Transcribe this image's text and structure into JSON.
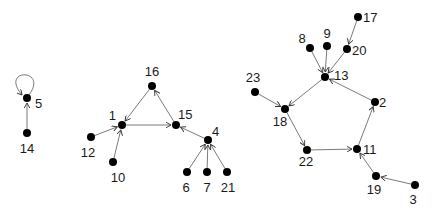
{
  "diagram": {
    "type": "directed-graph",
    "nodes": [
      {
        "id": "5",
        "x": 27,
        "y": 98,
        "lx": 35,
        "ly": 108,
        "anchor": "start"
      },
      {
        "id": "14",
        "x": 27,
        "y": 133,
        "lx": 27,
        "ly": 153,
        "anchor": "middle"
      },
      {
        "id": "16",
        "x": 152,
        "y": 86,
        "lx": 152,
        "ly": 76,
        "anchor": "middle"
      },
      {
        "id": "1",
        "x": 122,
        "y": 125,
        "lx": 116,
        "ly": 120,
        "anchor": "end"
      },
      {
        "id": "15",
        "x": 176,
        "y": 125,
        "lx": 178,
        "ly": 119,
        "anchor": "start"
      },
      {
        "id": "12",
        "x": 91,
        "y": 137,
        "lx": 88,
        "ly": 157,
        "anchor": "middle"
      },
      {
        "id": "10",
        "x": 113,
        "y": 162,
        "lx": 118,
        "ly": 182,
        "anchor": "middle"
      },
      {
        "id": "4",
        "x": 208,
        "y": 140,
        "lx": 212,
        "ly": 136,
        "anchor": "start"
      },
      {
        "id": "6",
        "x": 187,
        "y": 172,
        "lx": 186,
        "ly": 192,
        "anchor": "middle"
      },
      {
        "id": "7",
        "x": 207,
        "y": 172,
        "lx": 207,
        "ly": 192,
        "anchor": "middle"
      },
      {
        "id": "21",
        "x": 227,
        "y": 172,
        "lx": 228,
        "ly": 192,
        "anchor": "middle"
      },
      {
        "id": "17",
        "x": 358,
        "y": 17,
        "lx": 363,
        "ly": 22,
        "anchor": "start"
      },
      {
        "id": "20",
        "x": 347,
        "y": 49,
        "lx": 352,
        "ly": 55,
        "anchor": "start"
      },
      {
        "id": "8",
        "x": 310,
        "y": 48,
        "lx": 302,
        "ly": 43,
        "anchor": "middle"
      },
      {
        "id": "9",
        "x": 327,
        "y": 46,
        "lx": 327,
        "ly": 38,
        "anchor": "middle"
      },
      {
        "id": "13",
        "x": 325,
        "y": 77,
        "lx": 334,
        "ly": 80,
        "anchor": "start"
      },
      {
        "id": "23",
        "x": 255,
        "y": 92,
        "lx": 253,
        "ly": 82,
        "anchor": "middle"
      },
      {
        "id": "18",
        "x": 285,
        "y": 109,
        "lx": 280,
        "ly": 126,
        "anchor": "middle"
      },
      {
        "id": "2",
        "x": 375,
        "y": 102,
        "lx": 379,
        "ly": 107,
        "anchor": "start"
      },
      {
        "id": "22",
        "x": 307,
        "y": 150,
        "lx": 306,
        "ly": 166,
        "anchor": "middle"
      },
      {
        "id": "11",
        "x": 357,
        "y": 149,
        "lx": 363,
        "ly": 154,
        "anchor": "start"
      },
      {
        "id": "19",
        "x": 376,
        "y": 176,
        "lx": 374,
        "ly": 194,
        "anchor": "middle"
      },
      {
        "id": "3",
        "x": 415,
        "y": 185,
        "lx": 413,
        "ly": 204,
        "anchor": "middle"
      }
    ],
    "edges": [
      {
        "from": "5",
        "to": "5",
        "self_loop": true
      },
      {
        "from": "14",
        "to": "5"
      },
      {
        "from": "16",
        "to": "1"
      },
      {
        "from": "1",
        "to": "15"
      },
      {
        "from": "15",
        "to": "16"
      },
      {
        "from": "12",
        "to": "1"
      },
      {
        "from": "10",
        "to": "1"
      },
      {
        "from": "4",
        "to": "15"
      },
      {
        "from": "6",
        "to": "4"
      },
      {
        "from": "7",
        "to": "4"
      },
      {
        "from": "21",
        "to": "4"
      },
      {
        "from": "17",
        "to": "20"
      },
      {
        "from": "8",
        "to": "13"
      },
      {
        "from": "9",
        "to": "13"
      },
      {
        "from": "20",
        "to": "13"
      },
      {
        "from": "2",
        "to": "13"
      },
      {
        "from": "13",
        "to": "18"
      },
      {
        "from": "23",
        "to": "18"
      },
      {
        "from": "18",
        "to": "22"
      },
      {
        "from": "22",
        "to": "11"
      },
      {
        "from": "11",
        "to": "2"
      },
      {
        "from": "19",
        "to": "11"
      },
      {
        "from": "3",
        "to": "19"
      }
    ],
    "colors": {
      "node": "#000000",
      "edge": "#7a7a7a",
      "label": "#1a1a1a",
      "background": "#ffffff"
    }
  }
}
